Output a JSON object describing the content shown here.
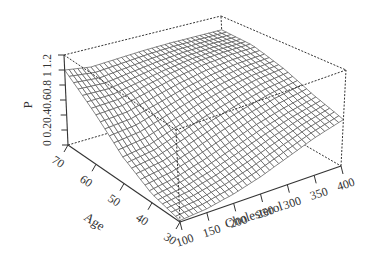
{
  "chart_data": {
    "type": "surface",
    "title": "",
    "xlabel": "Cholesterol",
    "ylabel": "Age",
    "zlabel": "P",
    "x_ticks": [
      100,
      150,
      200,
      250,
      300,
      350,
      400
    ],
    "y_ticks": [
      30,
      40,
      50,
      60,
      70
    ],
    "z_ticks": [
      "0",
      "0.2",
      "0.4",
      "0.6",
      "0.8",
      "1",
      "1.2"
    ],
    "xlim": [
      100,
      400
    ],
    "ylim": [
      30,
      70
    ],
    "zlim": [
      0,
      1.2
    ],
    "grid": false,
    "box": "dashed",
    "surface_samples": {
      "description": "approximate P over (Age rows, Cholesterol cols)",
      "cholesterol": [
        100,
        150,
        200,
        250,
        300,
        350,
        400
      ],
      "age": [
        30,
        40,
        50,
        60,
        70
      ],
      "P": [
        [
          0.02,
          0.05,
          0.12,
          0.22,
          0.35,
          0.48,
          0.58
        ],
        [
          0.12,
          0.18,
          0.28,
          0.4,
          0.52,
          0.62,
          0.7
        ],
        [
          0.35,
          0.4,
          0.52,
          0.64,
          0.74,
          0.82,
          0.86
        ],
        [
          0.7,
          0.72,
          0.8,
          0.88,
          0.94,
          0.97,
          0.98
        ],
        [
          1.0,
          0.95,
          0.97,
          0.99,
          1.0,
          1.0,
          1.0
        ]
      ]
    }
  },
  "axes": {
    "x_label": "Cholesterol",
    "y_label": "Age",
    "z_label": "P",
    "x_ticks": [
      "100",
      "150",
      "200",
      "250",
      "300",
      "350",
      "400"
    ],
    "y_ticks": [
      "30",
      "40",
      "50",
      "60",
      "70"
    ],
    "z_tick_text": "0 0.20.40.60.8 1 1.2"
  },
  "style": {
    "line_color": "#333333",
    "mesh_color": "#555555",
    "background": "#ffffff"
  }
}
